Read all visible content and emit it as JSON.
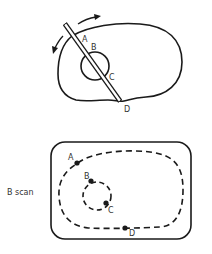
{
  "figure": {
    "top_panel": {
      "description": "Transducer sweeping across an organ containing a circular structure",
      "labels": {
        "a": "A",
        "b": "B",
        "c": "C",
        "d": "D"
      }
    },
    "bottom_panel": {
      "side_label": "B scan",
      "labels": {
        "a": "A",
        "b": "B",
        "c": "C",
        "d": "D"
      }
    },
    "colors": {
      "stroke": "#1a1a1a",
      "text": "#333333",
      "background": "#ffffff"
    }
  }
}
